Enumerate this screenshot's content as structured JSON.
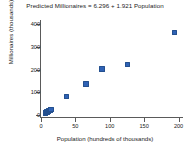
{
  "chart_data": {
    "type": "scatter",
    "title": "Predicted Millionaires = 6.296 + 1.921 Population",
    "xlabel": "Population (hundreds of thousands)",
    "ylabel": "Millionaires (thousands)",
    "xlim": [
      0,
      205
    ],
    "ylim": [
      -10,
      410
    ],
    "xticks": [
      0,
      50,
      100,
      150,
      200
    ],
    "yticks": [
      0,
      100,
      200,
      300,
      400
    ],
    "xtick_labels": [
      "0",
      "50",
      "100",
      "150",
      "200"
    ],
    "ytick_labels": [
      "0",
      "100",
      "200",
      "300",
      "400"
    ],
    "grid": false,
    "legend": "none",
    "marker_color": "#2f62b5",
    "axis_color": "#5a5a5a",
    "regression": {
      "intercept": 6.296,
      "slope": 1.921,
      "equation": "Predicted Millionaires = 6.296 + 1.921 Population",
      "line_shown": false
    },
    "points": [
      {
        "x": 5,
        "y": 12
      },
      {
        "x": 6,
        "y": 14
      },
      {
        "x": 7,
        "y": 16
      },
      {
        "x": 8,
        "y": 19
      },
      {
        "x": 9,
        "y": 21
      },
      {
        "x": 11,
        "y": 24
      },
      {
        "x": 12,
        "y": 26
      },
      {
        "x": 13,
        "y": 28
      },
      {
        "x": 36,
        "y": 85
      },
      {
        "x": 64,
        "y": 140
      },
      {
        "x": 87,
        "y": 207
      },
      {
        "x": 124,
        "y": 227
      },
      {
        "x": 193,
        "y": 367
      }
    ]
  }
}
